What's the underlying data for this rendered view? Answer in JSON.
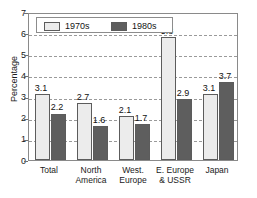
{
  "chart_data": {
    "type": "bar",
    "title": "",
    "xlabel": "",
    "ylabel": "Percentage",
    "ylim": [
      0,
      7
    ],
    "yticks": [
      0,
      1,
      2,
      3,
      4,
      5,
      6,
      7
    ],
    "ytick_labels": [
      "0",
      "1",
      "2",
      "3",
      "4",
      "5",
      "6",
      "7"
    ],
    "grid": true,
    "grid_style": "dashed-horizontal",
    "legend_position": "top-left-inside",
    "categories": [
      "Total",
      "North America",
      "West. Europe",
      "E. Europe & USSR",
      "Japan"
    ],
    "category_lines": [
      [
        "Total"
      ],
      [
        "North",
        "America"
      ],
      [
        "West.",
        "Europe"
      ],
      [
        "E. Europe",
        "& USSR"
      ],
      [
        "Japan"
      ]
    ],
    "series": [
      {
        "name": "1970s",
        "color": "#ececec",
        "values": [
          3.1,
          2.7,
          2.1,
          5.8,
          3.1
        ],
        "labels": [
          "3.1",
          "2.7",
          "2.1",
          "5.8",
          "3.1"
        ]
      },
      {
        "name": "1980s",
        "color": "#5e5e5e",
        "values": [
          2.2,
          1.6,
          1.7,
          2.9,
          3.7
        ],
        "labels": [
          "2.2",
          "1.6",
          "1.7",
          "2.9",
          "3.7"
        ]
      }
    ]
  },
  "legend": {
    "items": [
      {
        "label": "1970s"
      },
      {
        "label": "1980s"
      }
    ]
  },
  "colors": {
    "series_1970s": "#ececec",
    "series_1980s": "#5e5e5e",
    "bar_edge": "#5c5c5c",
    "grid": "#9a9a9a",
    "frame": "#8a8a8a",
    "text": "#1a1a1a",
    "background": "#ffffff"
  }
}
